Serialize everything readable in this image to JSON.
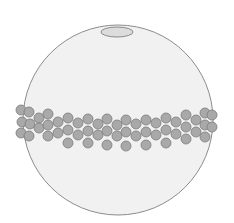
{
  "diagram": {
    "colors": {
      "background": "#ffffff",
      "cell_fill": "#f1f1f1",
      "cell_stroke": "#8c8c8c",
      "cap_fill": "#dcdcdc",
      "cap_stroke": "#8a8a8a",
      "bead_fill": "#a9a9a9",
      "bead_stroke": "#7a7a7a"
    },
    "cell": {
      "cx": 118,
      "cy": 120,
      "r": 95
    },
    "cap": {
      "cx": 117,
      "cy": 32,
      "rx": 16,
      "ry": 5
    },
    "bead_radius": 5,
    "beads": [
      [
        21,
        110
      ],
      [
        29,
        112
      ],
      [
        22,
        122
      ],
      [
        30,
        124
      ],
      [
        21,
        133
      ],
      [
        29,
        136
      ],
      [
        39,
        118
      ],
      [
        39,
        128
      ],
      [
        48,
        114
      ],
      [
        48,
        125
      ],
      [
        48,
        136
      ],
      [
        58,
        122
      ],
      [
        58,
        133
      ],
      [
        68,
        118
      ],
      [
        68,
        130
      ],
      [
        68,
        143
      ],
      [
        78,
        123
      ],
      [
        78,
        135
      ],
      [
        88,
        119
      ],
      [
        88,
        131
      ],
      [
        88,
        143
      ],
      [
        98,
        124
      ],
      [
        98,
        135
      ],
      [
        107,
        119
      ],
      [
        107,
        131
      ],
      [
        107,
        145
      ],
      [
        117,
        125
      ],
      [
        117,
        136
      ],
      [
        126,
        120
      ],
      [
        126,
        132
      ],
      [
        126,
        146
      ],
      [
        136,
        124
      ],
      [
        136,
        136
      ],
      [
        146,
        120
      ],
      [
        146,
        132
      ],
      [
        146,
        145
      ],
      [
        156,
        123
      ],
      [
        156,
        135
      ],
      [
        166,
        118
      ],
      [
        166,
        130
      ],
      [
        166,
        143
      ],
      [
        176,
        122
      ],
      [
        176,
        134
      ],
      [
        186,
        115
      ],
      [
        186,
        127
      ],
      [
        186,
        139
      ],
      [
        196,
        120
      ],
      [
        196,
        132
      ],
      [
        205,
        113
      ],
      [
        205,
        125
      ],
      [
        205,
        137
      ],
      [
        212,
        115
      ],
      [
        212,
        127
      ]
    ]
  }
}
